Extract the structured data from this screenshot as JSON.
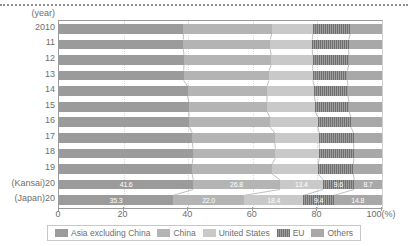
{
  "chart_data": {
    "type": "bar",
    "subtype": "100% stacked horizontal bar",
    "title": "",
    "xlabel": "100(%)",
    "ylabel": "(year)",
    "xlim": [
      0,
      100
    ],
    "xticks": [
      "0",
      "20",
      "40",
      "60",
      "80",
      "100(%)"
    ],
    "xtick_values": [
      0,
      20,
      40,
      60,
      80,
      100
    ],
    "grid": true,
    "legend_position": "bottom",
    "categories": [
      "2010",
      "11",
      "12",
      "13",
      "14",
      "15",
      "16",
      "17",
      "18",
      "19",
      "(Kansai)20",
      "(Japan)20"
    ],
    "series": [
      {
        "name": "Asia excluding China",
        "color": "#9b9b9b",
        "values": [
          38.5,
          38.5,
          38.7,
          38.6,
          39.8,
          40.2,
          40.3,
          41.3,
          41.5,
          41.2,
          41.6,
          35.3
        ]
      },
      {
        "name": "China",
        "color": "#b4b4b4",
        "values": [
          27.4,
          26.9,
          27.0,
          26.4,
          24.6,
          24.2,
          25.0,
          25.5,
          25.5,
          24.7,
          26.8,
          22.0
        ]
      },
      {
        "name": "United States",
        "color": "#c9c9c9",
        "values": [
          12.7,
          13.0,
          12.8,
          13.6,
          14.6,
          15.0,
          14.8,
          13.8,
          13.6,
          14.3,
          13.4,
          18.4
        ]
      },
      {
        "name": "EU",
        "color": "#6f6f6f",
        "values": [
          11.6,
          11.3,
          11.2,
          10.7,
          10.5,
          10.4,
          10.3,
          10.6,
          10.7,
          10.9,
          9.6,
          9.4
        ]
      },
      {
        "name": "Others",
        "color": "#a8a8a8",
        "values": [
          9.8,
          10.3,
          10.3,
          10.7,
          10.5,
          10.2,
          9.6,
          8.8,
          8.7,
          8.9,
          8.7,
          14.8
        ]
      }
    ],
    "data_labels": {
      "(Kansai)20": [
        "41.6",
        "26.8",
        "13.4",
        "9.6",
        "8.7"
      ],
      "(Japan)20": [
        "35.3",
        "22.0",
        "18.4",
        "9.4",
        "14.8"
      ]
    }
  },
  "axis": {
    "y_caption": "(year)",
    "y_labels": [
      "2010",
      "11",
      "12",
      "13",
      "14",
      "15",
      "16",
      "17",
      "18",
      "19",
      "(Kansai)20",
      "(Japan)20"
    ],
    "x_labels": [
      "0",
      "20",
      "40",
      "60",
      "80",
      "100(%)"
    ]
  },
  "legend": {
    "items": [
      {
        "label": "Asia excluding China",
        "swatch": "s0"
      },
      {
        "label": "China",
        "swatch": "s1"
      },
      {
        "label": "United States",
        "swatch": "s2"
      },
      {
        "label": "EU",
        "swatch": "s3"
      },
      {
        "label": "Others",
        "swatch": "s4"
      }
    ]
  }
}
